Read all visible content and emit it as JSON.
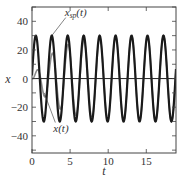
{
  "chart_data": {
    "type": "line",
    "title": "",
    "xlabel": "t",
    "ylabel": "x",
    "xlim": [
      0,
      18.9
    ],
    "ylim": [
      -52,
      50
    ],
    "grid": false,
    "legend": "none (inline annotations)",
    "xticks": [
      0,
      5,
      10,
      15
    ],
    "xtick_labels": [
      "0",
      "5",
      "10",
      "15"
    ],
    "yticks": [
      -40,
      -20,
      0,
      20,
      40
    ],
    "ytick_labels": [
      "−40",
      "−20",
      "0",
      "20",
      "40"
    ],
    "yminor_ticks": [
      -50,
      -30,
      -10,
      10,
      30,
      50
    ],
    "zero_line": true,
    "series": [
      {
        "name": "x_sp(t)",
        "color": "#1a1a1a",
        "linewidth": 2.2,
        "description": "setpoint sinusoid, amplitude 30, period ~2.09",
        "amplitude": 30,
        "omega": 3.0,
        "phase_peak_t": 0.5,
        "x": [
          0,
          0.5,
          1.02,
          1.55,
          2.07,
          2.59,
          3.12,
          3.64,
          4.16,
          4.69,
          5.21,
          5.73,
          6.26,
          6.78,
          7.3,
          7.83,
          8.35,
          8.87,
          9.4,
          9.92,
          10.44,
          10.97,
          11.49,
          12.01,
          12.54,
          13.06,
          13.58,
          14.11,
          14.63,
          15.15,
          15.68,
          16.2,
          16.72,
          17.25,
          17.77,
          18.29,
          18.82
        ],
        "values": [
          2,
          30,
          0,
          -30,
          0,
          30,
          0,
          -30,
          0,
          30,
          0,
          -30,
          0,
          30,
          0,
          -30,
          0,
          30,
          0,
          -30,
          0,
          30,
          0,
          -30,
          0,
          30,
          0,
          -30,
          0,
          30,
          0,
          -30,
          0,
          30,
          0,
          -30,
          0
        ]
      },
      {
        "name": "x(t)",
        "color": "#8c8c8c",
        "linewidth": 1.6,
        "description": "response converging to x_sp(t)",
        "tau": 3.0,
        "lag": 0.15,
        "x": [
          0,
          0.6,
          1.6,
          2.6,
          3.7,
          4.8,
          5.8,
          6.9,
          7.9,
          9.0,
          10.0,
          12.0,
          15.0,
          18.0
        ],
        "values": [
          0,
          3,
          -8,
          12,
          -15,
          19,
          -21,
          23,
          -25,
          26,
          -27,
          28.5,
          29.5,
          30
        ]
      }
    ],
    "annotations": [
      {
        "text": "x_sp(t)",
        "main": "x",
        "sub": "sp",
        "tail": "(t)",
        "at": [
          4.3,
          44
        ],
        "arrow_to": [
          2.6,
          30
        ]
      },
      {
        "text": "x(t)",
        "main": "x(t)",
        "at": [
          2.8,
          -37
        ],
        "arrow_to": [
          1.6,
          -10
        ]
      }
    ]
  }
}
